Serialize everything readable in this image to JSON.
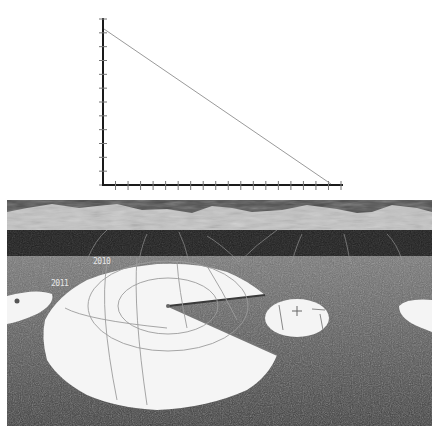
{
  "chart_data": {
    "type": "line",
    "title": "",
    "xlabel": "",
    "ylabel": "",
    "x_tick_count": 19,
    "y_tick_count": 12,
    "x": [
      0,
      1
    ],
    "series": [
      {
        "name": "line",
        "values": [
          0.95,
          0.0
        ],
        "color": "#9a9a9a"
      }
    ],
    "xlim": [
      0,
      1
    ],
    "ylim": [
      0,
      1
    ],
    "grid": false,
    "axis_color": "#1a1a1a"
  },
  "scene": {
    "labels": [
      {
        "id": "label-a",
        "text": "2010"
      },
      {
        "id": "label-b",
        "text": "2011"
      }
    ],
    "pie_color": "#f4f4f4",
    "terrain_color": "#6a6a6a",
    "mountain_color": "#bdbdbd",
    "sky_color": "#3a3a3a"
  }
}
